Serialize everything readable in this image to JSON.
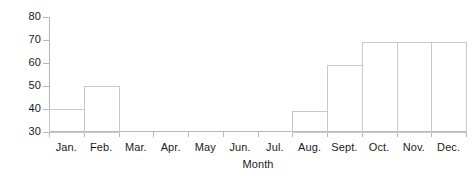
{
  "chart_data": {
    "type": "bar",
    "title": "",
    "xlabel": "Month",
    "ylabel": "Number",
    "categories": [
      "Jan.",
      "Feb.",
      "Mar.",
      "Apr.",
      "May",
      "Jun.",
      "Jul.",
      "Aug.",
      "Sept.",
      "Oct.",
      "Nov.",
      "Dec."
    ],
    "values": [
      40,
      50,
      0,
      0,
      0,
      0,
      0,
      39,
      59,
      69,
      69,
      69
    ],
    "ylim": [
      30,
      80
    ],
    "yticks": [
      30,
      40,
      50,
      60,
      70,
      80
    ],
    "ytick_labels": [
      "30",
      "40",
      "50",
      "60",
      "70",
      "80"
    ],
    "grid": false,
    "legend": null,
    "bar_style": "outlined-unfilled"
  },
  "colors": {
    "axis": "#b8b8b8",
    "bar_outline": "#c9c9c9",
    "bar_fill": "transparent",
    "text": "#1a1a1a",
    "background": "#ffffff"
  }
}
